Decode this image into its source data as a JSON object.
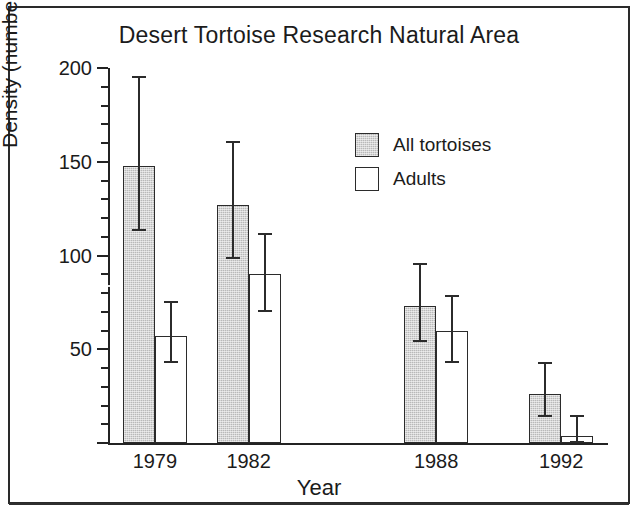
{
  "figure": {
    "title": "Desert Tortoise Research Natural Area",
    "frame_color": "#2a2a2a",
    "background": "#ffffff"
  },
  "legend": {
    "position": "upper-right-inside",
    "entries": [
      {
        "label": "All tortoises",
        "swatch": "gray-hatched-swatch",
        "color": "#b9b9b9"
      },
      {
        "label": "Adults",
        "swatch": "white-swatch",
        "color": "#ffffff"
      }
    ]
  },
  "axes": {
    "y_title": "Density (number/km²)",
    "x_title": "Year",
    "y_ticks": [
      "50",
      "100",
      "150",
      "200"
    ],
    "y_tick_values": [
      50,
      100,
      150,
      200
    ],
    "y_minor_step": 10,
    "x_ticks": [
      "1979",
      "1982",
      "1988",
      "1992"
    ]
  },
  "chart_data": {
    "type": "bar",
    "title": "Desert Tortoise Research Natural Area",
    "xlabel": "Year",
    "ylabel": "Density (number/km²)",
    "categories": [
      "1979",
      "1982",
      "1988",
      "1992"
    ],
    "x": [
      1979,
      1982,
      1988,
      1992
    ],
    "xlim": [
      1977.5,
      1993.5
    ],
    "ylim": [
      0,
      200
    ],
    "grid": false,
    "legend_position": "upper right",
    "error_bars": "95% confidence interval (asymmetric whiskers shown)",
    "series": [
      {
        "name": "All tortoises",
        "color": "#b9b9b9",
        "values": [
          148,
          127,
          73,
          26
        ],
        "err_low": [
          114,
          99,
          55,
          15
        ],
        "err_high": [
          196,
          161,
          96,
          43
        ]
      },
      {
        "name": "Adults",
        "color": "#ffffff",
        "values": [
          57,
          90,
          60,
          4
        ],
        "err_low": [
          44,
          71,
          44,
          1
        ],
        "err_high": [
          76,
          112,
          79,
          15
        ]
      }
    ]
  }
}
